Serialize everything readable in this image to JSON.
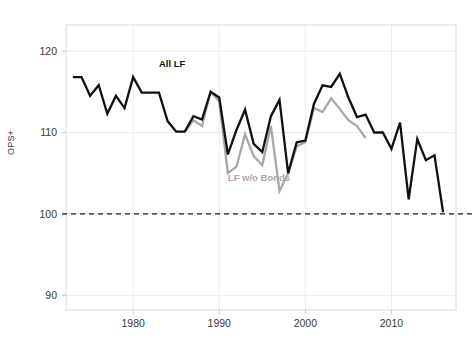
{
  "chart_data": {
    "type": "line",
    "title": "",
    "subtitle": "",
    "xlabel": "",
    "ylabel": "OPS+",
    "xlim": [
      1972.2,
      1917.0
    ],
    "x_range": [
      1972.2,
      2017.5
    ],
    "ylim": [
      88.2,
      123.2
    ],
    "grid": true,
    "grid_axis": "both",
    "legend_position": "inline-annotation",
    "reference_lines": [
      {
        "axis": "y",
        "value": 100,
        "style": "dashed",
        "color": "#1a1a1a"
      }
    ],
    "xticks": [
      1980,
      1990,
      2000,
      2010
    ],
    "xtick_labels": [
      "1980",
      "1990",
      "2000",
      "2010"
    ],
    "yticks": [
      90,
      100,
      110,
      120
    ],
    "ytick_labels": [
      "90",
      "100",
      "110",
      "120"
    ],
    "series": [
      {
        "name": "All LF",
        "color": "#111111",
        "label_x": 1983.0,
        "label_y": 118.0,
        "x": [
          1973,
          1974,
          1975,
          1976,
          1977,
          1978,
          1979,
          1980,
          1981,
          1982,
          1983,
          1984,
          1985,
          1986,
          1987,
          1988,
          1989,
          1990,
          1991,
          1992,
          1993,
          1994,
          1995,
          1996,
          1997,
          1998,
          1999,
          2000,
          2001,
          2002,
          2003,
          2004,
          2005,
          2006,
          2007,
          2008,
          2009,
          2010,
          2011,
          2012,
          2013,
          2014,
          2015,
          2016
        ],
        "y": [
          116.8,
          116.8,
          114.5,
          115.8,
          112.3,
          114.5,
          113.0,
          116.8,
          114.9,
          114.9,
          114.9,
          111.4,
          110.1,
          110.1,
          112.0,
          111.6,
          115.0,
          114.3,
          107.3,
          110.3,
          112.8,
          108.6,
          107.6,
          112.0,
          114.0,
          105.0,
          108.8,
          109.0,
          113.5,
          115.8,
          115.6,
          117.2,
          114.3,
          111.9,
          112.2,
          110.0,
          110.0,
          108.0,
          111.2,
          101.8,
          109.2,
          106.6,
          107.2,
          100.2
        ]
      },
      {
        "name": "LF w/o Bonds",
        "color": "#a8a8a8",
        "label_x": 1991.0,
        "label_y": 104.0,
        "x": [
          1986,
          1987,
          1988,
          1989,
          1990,
          1991,
          1992,
          1993,
          1994,
          1995,
          1996,
          1997,
          1998,
          1999,
          2000,
          2001,
          2002,
          2003,
          2004,
          2005,
          2006,
          2007
        ],
        "y": [
          110.1,
          111.5,
          110.8,
          115.0,
          113.8,
          105.0,
          105.8,
          109.8,
          107.1,
          106.0,
          110.8,
          102.8,
          105.0,
          108.3,
          108.8,
          113.0,
          112.5,
          114.2,
          112.9,
          111.5,
          110.8,
          109.3
        ]
      }
    ]
  },
  "plot": {
    "left_px": 66,
    "right_px": 456,
    "top_px": 25,
    "bottom_px": 310,
    "frame_color": "#d9d9d9",
    "grid_color": "#ececec",
    "background": "#ffffff"
  },
  "labels": {
    "y_axis": "OPS+"
  }
}
